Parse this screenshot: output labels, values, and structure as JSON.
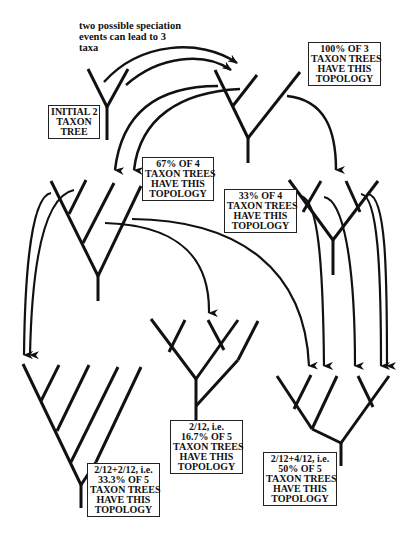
{
  "caption": {
    "lines": [
      "two possible speciation",
      "events can lead to 3",
      "taxa"
    ]
  },
  "labels": {
    "initial": {
      "lines": [
        "INITIAL 2",
        "TAXON",
        "TREE"
      ]
    },
    "three_taxon": {
      "lines": [
        "100% OF 3",
        "TAXON TREES",
        "HAVE THIS",
        "TOPOLOGY"
      ]
    },
    "four_pectinate": {
      "lines": [
        "67% OF 4",
        "TAXON TREES",
        "HAVE THIS",
        "TOPOLOGY"
      ]
    },
    "four_balanced": {
      "lines": [
        "33% OF 4",
        "TAXON TREES",
        "HAVE THIS",
        "TOPOLOGY"
      ]
    },
    "five_pectinate": {
      "lines": [
        "2/12+2/12, i.e.",
        "33.3% OF 5",
        "TAXON TREES",
        "HAVE THIS",
        "TOPOLOGY"
      ]
    },
    "five_mixed": {
      "lines": [
        "2/12, i.e.",
        "16.7% OF 5",
        "TAXON TREES",
        "HAVE THIS",
        "TOPOLOGY"
      ]
    },
    "five_balanced": {
      "lines": [
        "2/12+4/12, i.e.",
        "50% OF 5",
        "TAXON TREES",
        "HAVE THIS",
        "TOPOLOGY"
      ]
    }
  },
  "colors": {
    "ink": "#111111",
    "background": "#ffffff",
    "box_border": "#222222"
  }
}
